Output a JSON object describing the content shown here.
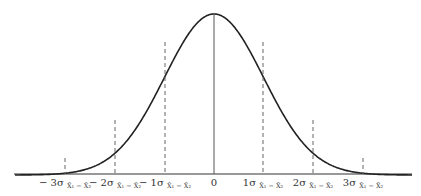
{
  "diagram": {
    "type": "normal-distribution-curve",
    "center_label": "0",
    "ticks": [
      {
        "id": "neg3",
        "x": 65,
        "top": 158,
        "coef": "− 3σ",
        "sub": "X̄₁ − X̄₂",
        "style": "dashed"
      },
      {
        "id": "neg2",
        "x": 115,
        "top": 120,
        "coef": "− 2σ",
        "sub": "X̄₁ − X̄₂",
        "style": "dashed"
      },
      {
        "id": "neg1",
        "x": 165,
        "top": 40,
        "coef": "− 1σ",
        "sub": "X̄₁ − X̄₂",
        "style": "dashed"
      },
      {
        "id": "zero",
        "x": 214,
        "top": 14,
        "coef": "0",
        "sub": "",
        "style": "solid"
      },
      {
        "id": "pos1",
        "x": 263,
        "top": 40,
        "coef": "1σ",
        "sub": "X̄₁ − X̄₂",
        "style": "dashed"
      },
      {
        "id": "pos2",
        "x": 313,
        "top": 120,
        "coef": "2σ",
        "sub": "X̄₁ − X̄₂",
        "style": "dashed"
      },
      {
        "id": "pos3",
        "x": 363,
        "top": 158,
        "coef": "3σ",
        "sub": "X̄₁ − X̄₂",
        "style": "dashed"
      }
    ],
    "labels": {
      "neg3": {
        "coef": "− 3σ",
        "sub": "X̄₁ − X̄₂"
      },
      "neg2": {
        "coef": "− 2σ",
        "sub": "X̄₁ − X̄₂"
      },
      "neg1": {
        "coef": "− 1σ",
        "sub": "X̄₁ − X̄₂"
      },
      "zero": {
        "coef": "0",
        "sub": ""
      },
      "pos1": {
        "coef": "1σ",
        "sub": "X̄₁ − X̄₂"
      },
      "pos2": {
        "coef": "2σ",
        "sub": "X̄₁ − X̄₂"
      },
      "pos3": {
        "coef": "3σ",
        "sub": "X̄₁ − X̄₂"
      }
    },
    "colors": {
      "curve": "#222222",
      "lines": "#444444",
      "background": "#ffffff"
    }
  }
}
